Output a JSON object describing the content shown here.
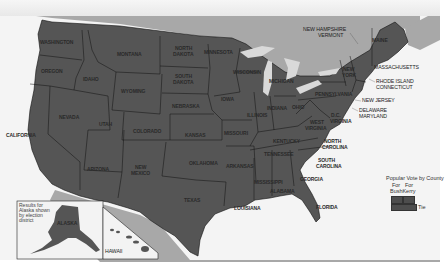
{
  "map": {
    "title": "Popular Vote by County",
    "colors": {
      "land_state": "#555555",
      "land_foreign": "#a8a8a8",
      "water": "#f2f2f2",
      "great_lakes": "#d9d9d9",
      "borders": "#111111",
      "text": "#2a2a2a"
    },
    "states": {
      "washington": "WASHINGTON",
      "oregon": "OREGON",
      "california": "CALIFORNIA",
      "idaho": "IDAHO",
      "nevada": "NEVADA",
      "montana": "MONTANA",
      "wyoming": "WYOMING",
      "utah": "UTAH",
      "arizona": "ARIZONA",
      "colorado": "COLORADO",
      "new_mexico_1": "NEW",
      "new_mexico_2": "MEXICO",
      "north_dakota_1": "NORTH",
      "north_dakota_2": "DAKOTA",
      "south_dakota_1": "SOUTH",
      "south_dakota_2": "DAKOTA",
      "nebraska": "NEBRASKA",
      "kansas": "KANSAS",
      "oklahoma": "OKLAHOMA",
      "texas": "TEXAS",
      "minnesota": "MINNESOTA",
      "iowa": "IOWA",
      "missouri": "MISSOURI",
      "arkansas": "ARKANSAS",
      "louisiana": "LOUISIANA",
      "wisconsin": "WISCONSIN",
      "illinois": "ILLINOIS",
      "michigan": "MICHIGAN",
      "indiana": "INDIANA",
      "ohio": "OHIO",
      "kentucky": "KENTUCKY",
      "tennessee": "TENNESSEE",
      "mississippi": "MISSISSIPPI",
      "alabama": "ALABAMA",
      "georgia": "GEORGIA",
      "florida": "FLORIDA",
      "south_carolina_1": "SOUTH",
      "south_carolina_2": "CAROLINA",
      "north_carolina_1": "NORTH",
      "north_carolina_2": "CAROLINA",
      "virginia": "VIRGINIA",
      "west_virginia_1": "WEST",
      "west_virginia_2": "VIRGINIA",
      "dc": "D.C.",
      "pennsylvania": "PENNSYLVANIA",
      "new_york_1": "NEW",
      "new_york_2": "YORK",
      "maine": "MAINE",
      "new_hampshire": "NEW HAMPSHIRE",
      "vermont": "VERMONT",
      "massachusetts": "MASSACHUSETTS",
      "rhode_island": "RHODE ISLAND",
      "connecticut": "CONNECTICUT",
      "new_jersey": "NEW JERSEY",
      "delaware": "DELAWARE",
      "maryland": "MARYLAND",
      "alaska": "ALASKA",
      "hawaii": "HAWAII"
    },
    "alaska_inset_note": "Results for Alaska shown by election district",
    "legend": {
      "title": "Popular Vote by County",
      "items": [
        {
          "label_1": "For",
          "label_2": "Bush",
          "color": "#4d4d4d"
        },
        {
          "label_1": "For",
          "label_2": "Kerry",
          "color": "#4d4d4d"
        },
        {
          "label_1": "Tie",
          "label_2": "",
          "color": "#4d4d4d"
        }
      ]
    }
  }
}
